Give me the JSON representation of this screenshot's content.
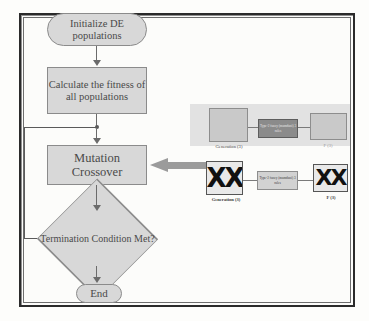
{
  "diagram": {
    "colors": {
      "node_fill": "#d8d8d8",
      "node_border": "#8b8b8b",
      "text": "#4a4a4a",
      "connector": "#6b6b6b",
      "feed_arrow": "#9b9b9b",
      "band": "#e2e2e2",
      "rule_top_fill": "#8b8b8b",
      "rule_bottom_fill": "#d2d2d2",
      "frame_border": "#2b2b2b"
    }
  },
  "flow": {
    "start": {
      "label": "Initialize DE populations",
      "shape": "terminator"
    },
    "calculate": {
      "label": "Calculate the fitness of all populations",
      "shape": "process"
    },
    "mutation": {
      "label": "Mutation Crossover",
      "shape": "process"
    },
    "termination": {
      "label": "Termination Condition Met?",
      "shape": "decision"
    },
    "end": {
      "label": "End",
      "shape": "terminator"
    }
  },
  "panel": {
    "top_row": {
      "generation_label": "Generation (3)",
      "rule_label": "Type-2 fuzzy (mamdani) 3 rules",
      "f_label": "F (3)"
    },
    "bottom_row": {
      "generation_label": "Generation (3)",
      "rule_label": "Type-2 fuzzy (mamdani) 3 rules",
      "f_label": "F (3)",
      "glyph": "XX"
    }
  }
}
